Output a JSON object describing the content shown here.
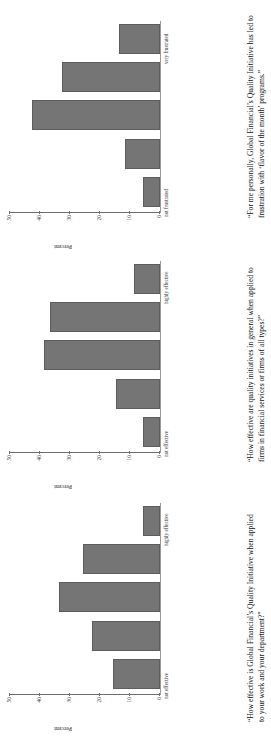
{
  "figure": {
    "orientation": "rotated-90",
    "bar_color": "#757575",
    "panel_count": 3
  },
  "chart_data": [
    {
      "id": "panel-1",
      "type": "bar",
      "title": "",
      "caption": "“How effective is Global Financial’s Quality Initiative when applied to your work and your department?”",
      "xlabel": "",
      "ylabel": "Percent",
      "categories": [
        "not effective",
        "",
        "",
        "",
        "highly effective"
      ],
      "tick_labels": [
        "not effective",
        "highly effective"
      ],
      "values": [
        15,
        22,
        33,
        25,
        5
      ],
      "yticks": [
        0,
        10,
        20,
        30,
        40,
        50
      ],
      "ylim": [
        0,
        50
      ],
      "grid": false,
      "legend": "none"
    },
    {
      "id": "panel-2",
      "type": "bar",
      "title": "",
      "caption": "“How effective are quality initiatives in general when applied to firms in financial services or firms of all types?”",
      "xlabel": "",
      "ylabel": "Percent",
      "categories": [
        "not effective",
        "",
        "",
        "",
        "highly effective"
      ],
      "tick_labels": [
        "not effective",
        "highly effective"
      ],
      "values": [
        5,
        14,
        38,
        36,
        8
      ],
      "yticks": [
        0,
        10,
        20,
        30,
        40,
        50
      ],
      "ylim": [
        0,
        50
      ],
      "grid": false,
      "legend": "none"
    },
    {
      "id": "panel-3",
      "type": "bar",
      "title": "",
      "caption": "“For me personally, Global Financial’s Quality Initiative has led to frustration with ‘flavor of the month’ programs.”",
      "xlabel": "",
      "ylabel": "Percent",
      "categories": [
        "not frustrated",
        "",
        "",
        "",
        "very frustrated"
      ],
      "tick_labels": [
        "not frustrated",
        "very frustrated"
      ],
      "values": [
        5,
        11,
        42,
        32,
        13
      ],
      "yticks": [
        0,
        10,
        20,
        30,
        40,
        50
      ],
      "ylim": [
        0,
        50
      ],
      "grid": false,
      "legend": "none"
    }
  ]
}
